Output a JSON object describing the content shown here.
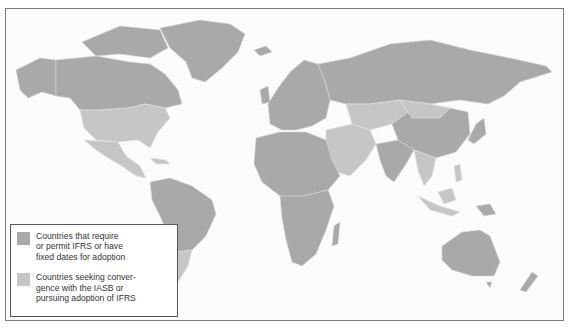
{
  "map": {
    "type": "world-choropleth",
    "description": "IFRS adoption status by country",
    "colors": {
      "require_permit": "#a9a9a9",
      "seeking_convergence": "#c6c6c6",
      "background": "#fbfbfb",
      "border": "#7a7a7a"
    }
  },
  "legend": {
    "items": [
      {
        "label": "Countries that require\nor permit IFRS or have\nfixed dates for adoption",
        "color": "#a9a9a9"
      },
      {
        "label": "Countries seeking conver-\ngence with the IASB or\npursuing adoption of IFRS",
        "color": "#c6c6c6"
      }
    ]
  }
}
